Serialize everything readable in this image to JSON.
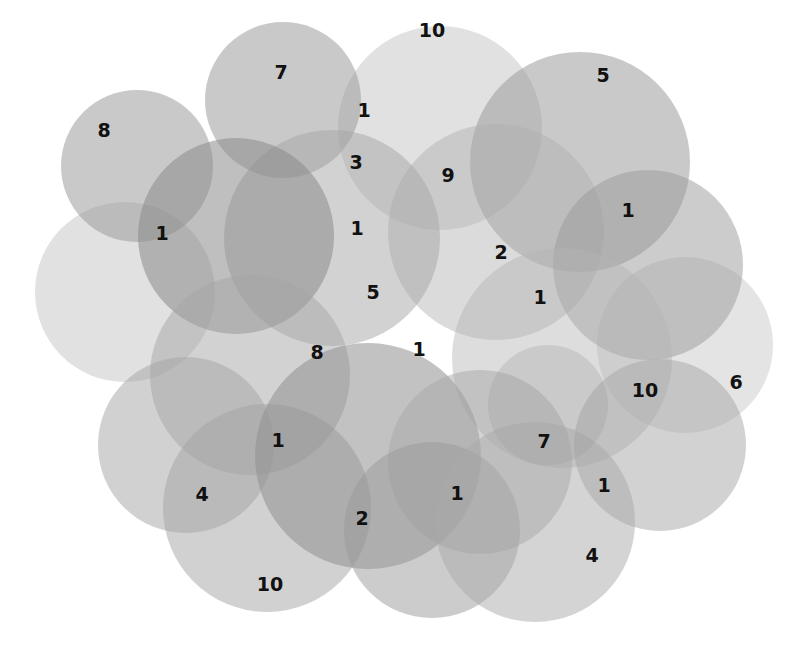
{
  "diagram": {
    "type": "overlapping-circles",
    "background": "#ffffff",
    "circles": [
      {
        "cx": 440,
        "cy": 128,
        "r": 102,
        "fill": "#bdbdbd",
        "opacity": 0.45
      },
      {
        "cx": 125,
        "cy": 292,
        "r": 90,
        "fill": "#bdbdbd",
        "opacity": 0.45
      },
      {
        "cx": 685,
        "cy": 345,
        "r": 88,
        "fill": "#c4c4c4",
        "opacity": 0.45
      },
      {
        "cx": 137,
        "cy": 166,
        "r": 76,
        "fill": "#9c9c9c",
        "opacity": 0.55
      },
      {
        "cx": 283,
        "cy": 100,
        "r": 78,
        "fill": "#9c9c9c",
        "opacity": 0.55
      },
      {
        "cx": 580,
        "cy": 162,
        "r": 110,
        "fill": "#9c9c9c",
        "opacity": 0.55
      },
      {
        "cx": 496,
        "cy": 232,
        "r": 108,
        "fill": "#b0b0b0",
        "opacity": 0.45
      },
      {
        "cx": 332,
        "cy": 238,
        "r": 108,
        "fill": "#a6a6a6",
        "opacity": 0.5
      },
      {
        "cx": 236,
        "cy": 236,
        "r": 98,
        "fill": "#8a8a8a",
        "opacity": 0.55
      },
      {
        "cx": 648,
        "cy": 265,
        "r": 95,
        "fill": "#999999",
        "opacity": 0.5
      },
      {
        "cx": 562,
        "cy": 358,
        "r": 110,
        "fill": "#b3b3b3",
        "opacity": 0.45
      },
      {
        "cx": 250,
        "cy": 375,
        "r": 100,
        "fill": "#a6a6a6",
        "opacity": 0.5
      },
      {
        "cx": 186,
        "cy": 445,
        "r": 88,
        "fill": "#a3a3a3",
        "opacity": 0.5
      },
      {
        "cx": 267,
        "cy": 508,
        "r": 104,
        "fill": "#a3a3a3",
        "opacity": 0.5
      },
      {
        "cx": 368,
        "cy": 456,
        "r": 113,
        "fill": "#8f8f8f",
        "opacity": 0.55
      },
      {
        "cx": 480,
        "cy": 462,
        "r": 92,
        "fill": "#a8a8a8",
        "opacity": 0.5
      },
      {
        "cx": 432,
        "cy": 530,
        "r": 88,
        "fill": "#9a9a9a",
        "opacity": 0.5
      },
      {
        "cx": 535,
        "cy": 522,
        "r": 100,
        "fill": "#aaaaaa",
        "opacity": 0.5
      },
      {
        "cx": 660,
        "cy": 445,
        "r": 86,
        "fill": "#a6a6a6",
        "opacity": 0.5
      },
      {
        "cx": 548,
        "cy": 405,
        "r": 60,
        "fill": "#a0a0a0",
        "opacity": 0.3
      }
    ],
    "labels": [
      {
        "text": "10",
        "x": 432,
        "y": 30
      },
      {
        "text": "7",
        "x": 281,
        "y": 72
      },
      {
        "text": "5",
        "x": 603,
        "y": 75
      },
      {
        "text": "8",
        "x": 104,
        "y": 130
      },
      {
        "text": "1",
        "x": 364,
        "y": 110
      },
      {
        "text": "3",
        "x": 356,
        "y": 162
      },
      {
        "text": "9",
        "x": 448,
        "y": 175
      },
      {
        "text": "1",
        "x": 628,
        "y": 210
      },
      {
        "text": "1",
        "x": 162,
        "y": 233
      },
      {
        "text": "1",
        "x": 357,
        "y": 228
      },
      {
        "text": "2",
        "x": 501,
        "y": 252
      },
      {
        "text": "5",
        "x": 373,
        "y": 292
      },
      {
        "text": "1",
        "x": 540,
        "y": 297
      },
      {
        "text": "8",
        "x": 317,
        "y": 352
      },
      {
        "text": "1",
        "x": 419,
        "y": 349
      },
      {
        "text": "10",
        "x": 645,
        "y": 390
      },
      {
        "text": "6",
        "x": 736,
        "y": 382
      },
      {
        "text": "1",
        "x": 278,
        "y": 440
      },
      {
        "text": "7",
        "x": 544,
        "y": 441
      },
      {
        "text": "4",
        "x": 202,
        "y": 494
      },
      {
        "text": "1",
        "x": 457,
        "y": 493
      },
      {
        "text": "1",
        "x": 604,
        "y": 485
      },
      {
        "text": "2",
        "x": 362,
        "y": 518
      },
      {
        "text": "4",
        "x": 592,
        "y": 555
      },
      {
        "text": "10",
        "x": 270,
        "y": 584
      }
    ]
  }
}
